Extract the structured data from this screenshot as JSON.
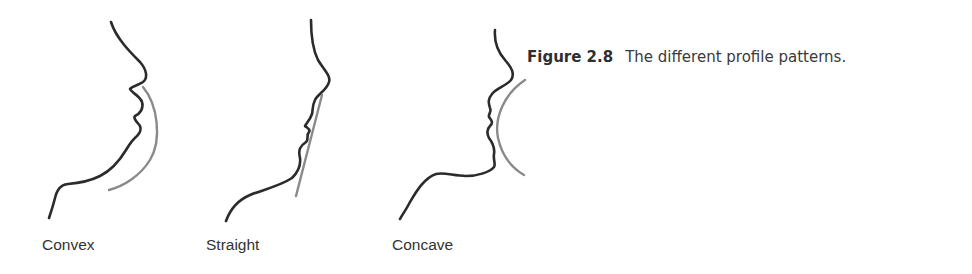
{
  "figure": {
    "number": "Figure 2.8",
    "caption": "The different profile patterns."
  },
  "profiles": [
    {
      "label": "Convex",
      "profile_type": "convex",
      "reference_line": "curved-convex"
    },
    {
      "label": "Straight",
      "profile_type": "straight",
      "reference_line": "straight"
    },
    {
      "label": "Concave",
      "profile_type": "concave",
      "reference_line": "curved-concave"
    }
  ],
  "colors": {
    "profile_stroke": "#2b2b2b",
    "reference_stroke": "#8a8a8a",
    "text": "#333333",
    "background": "#ffffff"
  }
}
